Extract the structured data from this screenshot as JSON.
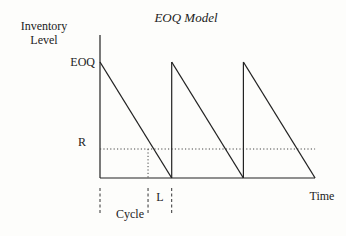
{
  "chart_data": {
    "type": "line",
    "title": "EOQ Model",
    "ylabel": [
      "Inventory",
      "Level"
    ],
    "xlabel": "Time",
    "y_levels": {
      "EOQ": 1.0,
      "R": 0.25
    },
    "y_tick_labels": [
      "EOQ",
      "R"
    ],
    "cycles": 3,
    "series": [
      {
        "name": "Inventory level",
        "pattern": "sawtooth",
        "peak": "EOQ",
        "trough": 0
      }
    ],
    "reorder_line": {
      "label": "R",
      "style": "dotted"
    },
    "annotations": {
      "cycle": "Cycle",
      "lead_time": "L"
    },
    "lead_time_fraction_of_cycle": 0.33
  },
  "text": {
    "title": "EOQ Model",
    "ylabel_line1": "Inventory",
    "ylabel_line2": "Level",
    "eoq": "EOQ",
    "r": "R",
    "time": "Time",
    "cycle": "Cycle",
    "l": "L"
  }
}
